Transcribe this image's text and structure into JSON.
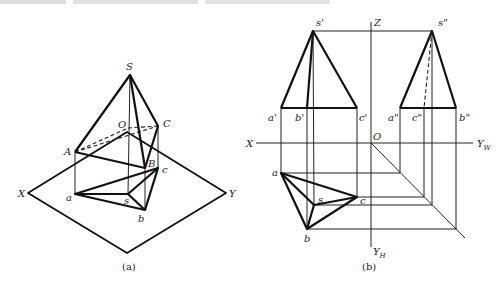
{
  "figure_a": {
    "caption": "(a)",
    "labels": {
      "S": "S",
      "O": "O",
      "C": "C",
      "A": "A",
      "B": "B",
      "c": "c",
      "a": "a",
      "s": "s",
      "b": "b",
      "X": "X",
      "Y": "Y"
    }
  },
  "figure_b": {
    "caption": "(b)",
    "labels": {
      "s1": "s'",
      "s2": "s\"",
      "Z": "Z",
      "a1": "a'",
      "b1": "b'",
      "c1": "c'",
      "a2": "a\"",
      "c2": "c\"",
      "b2": "b\"",
      "X": "X",
      "O": "O",
      "Yw": "Y",
      "Yw_sub": "W",
      "YH": "Y",
      "YH_sub": "H",
      "a": "a",
      "s": "s",
      "c": "c",
      "b": "b"
    }
  }
}
